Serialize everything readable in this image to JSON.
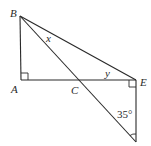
{
  "diagram": {
    "type": "geometry",
    "points": {
      "B": "B",
      "A": "A",
      "C": "C",
      "E": "E"
    },
    "angle_labels": {
      "x": "x",
      "y": "y",
      "bottom": "35°"
    },
    "segments": [
      "BA",
      "AE",
      "BE",
      "BD (through C)",
      "ED"
    ],
    "right_angles": [
      "A",
      "E"
    ],
    "stroke_color": "#2a2a2a",
    "background": "#ffffff"
  }
}
